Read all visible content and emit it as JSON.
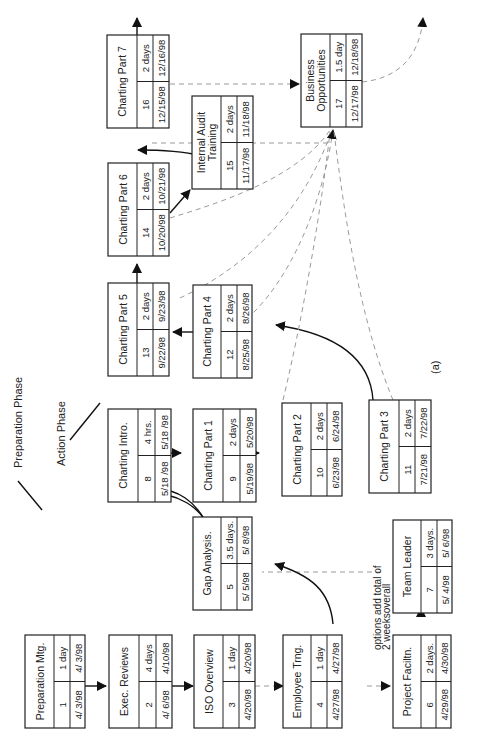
{
  "diagram": {
    "caption": "(a)",
    "phases": [
      {
        "label": "Preparation Phase"
      },
      {
        "label": "Action Phase"
      }
    ],
    "note": {
      "line1": "options add total of",
      "line2": "2 weeksoverall"
    },
    "nodes": [
      {
        "id": "1",
        "title": "Preparation Mtg.",
        "title2": "",
        "duration": "1 day",
        "start": "4/ 3/98",
        "end": "4/ 3/98"
      },
      {
        "id": "2",
        "title": "Exec. Reviews",
        "title2": "",
        "duration": "4 days",
        "start": "4/ 6/98",
        "end": "4/10/98"
      },
      {
        "id": "3",
        "title": "ISO Overview",
        "title2": "",
        "duration": "1 day",
        "start": "4/20/98",
        "end": "4/20/98"
      },
      {
        "id": "4",
        "title": "Employee Trng.",
        "title2": "",
        "duration": "1 day",
        "start": "4/27/98",
        "end": "4/27/98"
      },
      {
        "id": "5",
        "title": "Gap Analysis.",
        "title2": "",
        "duration": "3.5 days.",
        "start": "5/ 5/98",
        "end": "5/ 8/98"
      },
      {
        "id": "6",
        "title": "Project Faciltn.",
        "title2": "",
        "duration": "2 days.",
        "start": "4/29/98",
        "end": "4/30/98"
      },
      {
        "id": "7",
        "title": "Team Leader",
        "title2": "",
        "duration": "3 days.",
        "start": "5/ 4/98",
        "end": "5/ 6/98"
      },
      {
        "id": "8",
        "title": "Charting Intro.",
        "title2": "",
        "duration": "4 hrs.",
        "start": "5/18 /98",
        "end": "5/18 /98"
      },
      {
        "id": "9",
        "title": "Charting Part 1",
        "title2": "",
        "duration": "2 days",
        "start": "5/19/98",
        "end": "5/20/98"
      },
      {
        "id": "10",
        "title": "Charting Part 2",
        "title2": "",
        "duration": "2 days",
        "start": "6/23/98",
        "end": "6/24/98"
      },
      {
        "id": "11",
        "title": "Charting Part 3",
        "title2": "",
        "duration": "2 days",
        "start": "7/21/98",
        "end": "7/22/98"
      },
      {
        "id": "12",
        "title": "Charting Part 4",
        "title2": "",
        "duration": "2 days",
        "start": "8/25/98",
        "end": "8/26/98"
      },
      {
        "id": "13",
        "title": "Charting Part 5",
        "title2": "",
        "duration": "2 days",
        "start": "9/22/98",
        "end": "9/23/98"
      },
      {
        "id": "14",
        "title": "Charting Part 6",
        "title2": "",
        "duration": "2 days",
        "start": "10/20/98",
        "end": "10/21/98"
      },
      {
        "id": "15",
        "title": "Internal Audit",
        "title2": "Training",
        "duration": "2 days",
        "start": "11/17/98",
        "end": "11/18/98"
      },
      {
        "id": "16",
        "title": "Charting Part 7",
        "title2": "",
        "duration": "2 days",
        "start": "12/15/98",
        "end": "12/16/98"
      },
      {
        "id": "17",
        "title": "Business",
        "title2": "Opportunities",
        "duration": "1.5 day",
        "start": "12/17/98",
        "end": "12/18/98"
      }
    ]
  }
}
